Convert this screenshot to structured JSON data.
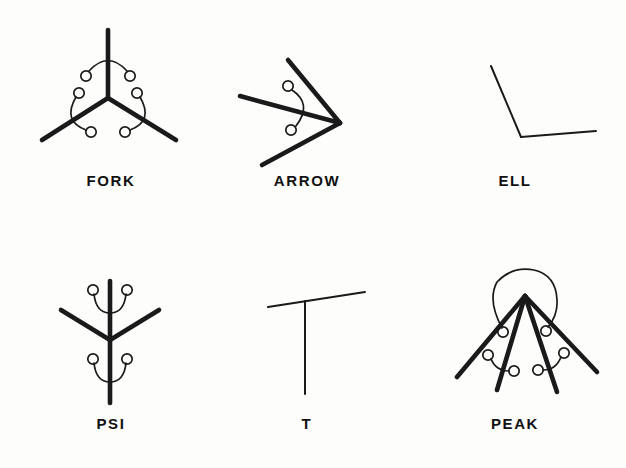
{
  "figure": {
    "background_color": "#fdfdfc",
    "ink_color": "#1a1a1a",
    "columns": 3,
    "rows": 2,
    "items": [
      {
        "id": "fork",
        "label": "FORK",
        "row": 0,
        "column": 0,
        "vertex": {
          "x": 108,
          "y": 98
        },
        "branch_count": 3,
        "branch_endpoints": [
          {
            "x": 108,
            "y": 30
          },
          {
            "x": 42,
            "y": 140
          },
          {
            "x": 176,
            "y": 140
          }
        ],
        "annotation_count": 3,
        "annotation_type": "arc-with-end-circles"
      },
      {
        "id": "arrow",
        "label": "ARROW",
        "row": 0,
        "column": 1,
        "vertex": {
          "x": 340,
          "y": 123
        },
        "branch_count": 3,
        "branch_endpoints": [
          {
            "x": 288,
            "y": 60
          },
          {
            "x": 240,
            "y": 96
          },
          {
            "x": 262,
            "y": 165
          }
        ],
        "annotation_count": 1,
        "annotation_type": "arc-with-end-circles"
      },
      {
        "id": "ell",
        "label": "ELL",
        "row": 0,
        "column": 2,
        "vertex": {
          "x": 521,
          "y": 137
        },
        "branch_count": 2,
        "branch_endpoints": [
          {
            "x": 491,
            "y": 66
          },
          {
            "x": 596,
            "y": 131
          }
        ],
        "annotation_count": 0,
        "annotation_type": "none"
      },
      {
        "id": "psi",
        "label": "PSI",
        "row": 1,
        "column": 0,
        "vertex": {
          "x": 110,
          "y": 340
        },
        "branch_count": 4,
        "branch_endpoints": [
          {
            "x": 110,
            "y": 281
          },
          {
            "x": 110,
            "y": 403
          },
          {
            "x": 61,
            "y": 310
          },
          {
            "x": 159,
            "y": 310
          }
        ],
        "annotation_count": 2,
        "annotation_type": "arc-with-end-circles"
      },
      {
        "id": "t",
        "label": "T",
        "row": 1,
        "column": 1,
        "vertex": {
          "x": 305,
          "y": 298
        },
        "branch_count": 3,
        "branch_endpoints": [
          {
            "x": 268,
            "y": 307
          },
          {
            "x": 365,
            "y": 292
          },
          {
            "x": 305,
            "y": 394
          }
        ],
        "annotation_count": 0,
        "annotation_type": "none"
      },
      {
        "id": "peak",
        "label": "PEAK",
        "row": 1,
        "column": 2,
        "vertex": {
          "x": 525,
          "y": 296
        },
        "branch_count": 4,
        "branch_endpoints": [
          {
            "x": 457,
            "y": 377
          },
          {
            "x": 497,
            "y": 390
          },
          {
            "x": 557,
            "y": 392
          },
          {
            "x": 597,
            "y": 372
          }
        ],
        "annotation_count": 3,
        "annotation_type": "arc-with-end-circles-plus-outer-arc"
      }
    ]
  }
}
